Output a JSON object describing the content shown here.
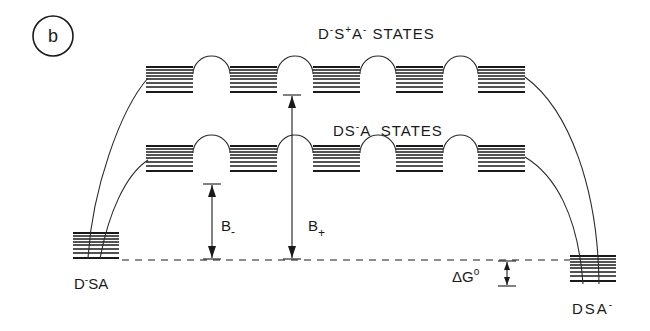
{
  "panel_label": "b",
  "labels": {
    "upper_states": {
      "base1": "D",
      "sup1": "-",
      "base2": "S",
      "sup2": "+",
      "base3": "A",
      "sup3": "-",
      "suffix": " STATES"
    },
    "lower_states": {
      "base1": "DS",
      "sup1": "-",
      "base2": "A",
      "suffix": "  STATES"
    },
    "left_state": {
      "base1": "D",
      "sup1": "-",
      "base2": "SA"
    },
    "right_state": {
      "base1": "DSA",
      "sup1": "-"
    },
    "b_minus": {
      "base": "B",
      "sub": "-"
    },
    "b_plus": {
      "base": "B",
      "sub": "+"
    },
    "delta_g": {
      "base": "ΔG",
      "sup": "o"
    }
  },
  "colors": {
    "ink": "#1a1a1a",
    "background": "#ffffff"
  },
  "levels": {
    "upper_stack_x": [
      146,
      230,
      313,
      396,
      478
    ],
    "lower_stack_x": [
      146,
      230,
      313,
      396,
      478
    ],
    "stack_width": 47,
    "upper_top_y": 67,
    "lower_top_y": 146,
    "left_stack": {
      "x": 73,
      "y": 230,
      "w": 46
    },
    "right_stack": {
      "x": 570,
      "y": 255,
      "w": 46
    },
    "baseline_y": 259
  }
}
